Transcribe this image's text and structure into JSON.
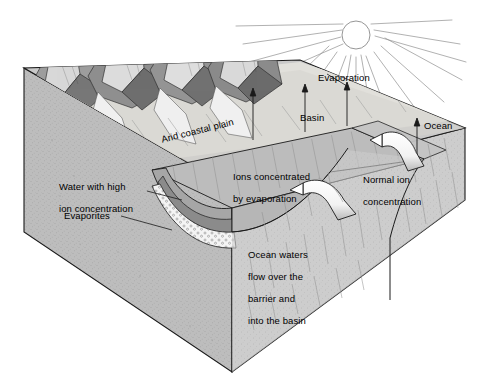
{
  "diagram": {
    "type": "geological-block-diagram",
    "background_color": "#ffffff",
    "ink_color": "#1a1a1a"
  },
  "labels": {
    "arid_coastal_plain": "Arid coastal plain",
    "basin": "Basin",
    "ocean": "Ocean",
    "evaporation": "Evaporation",
    "water_high_ion_line1": "Water with high",
    "water_high_ion_line2": "ion concentration",
    "evaporites": "Evaporites",
    "ions_concentrated_line1": "Ions concentrated",
    "ions_concentrated_line2": "by evaporation",
    "normal_ion_line1": "Normal ion",
    "normal_ion_line2": "concentration",
    "ocean_waters_line1": "Ocean waters",
    "ocean_waters_line2": "flow over the",
    "ocean_waters_line3": "barrier and",
    "ocean_waters_line4": "into the basin"
  },
  "icons": {
    "sun": "sun-icon",
    "evaporation_arrows": "up-arrow-icon",
    "flow_arrows": "curved-flow-arrow-icon"
  },
  "colors": {
    "top_surface": "#c9c9c9",
    "front_face": "#b4b4b4",
    "right_face": "#c0c0c0",
    "basin_water": "#a8a8a8",
    "deep_water": "#8f8f8f",
    "evaporites_fill": "#f2f2f2",
    "mountain_light": "#e8e8e8",
    "mountain_dark": "#6f6f6f",
    "plain_light": "#ededed",
    "outline": "#1a1a1a",
    "sun_stroke": "#8a8a8a"
  },
  "elements": {
    "sun_center": {
      "x": 356,
      "y": 35,
      "r": 14
    },
    "block_corners": {
      "left_top": {
        "x": 24,
        "y": 68
      },
      "front_apex": {
        "x": 232,
        "y": 355
      },
      "right_corner": {
        "x": 465,
        "y": 128
      },
      "back_right": {
        "x": 465,
        "y": 200
      },
      "bottom_front": {
        "x": 232,
        "y": 372
      }
    }
  }
}
